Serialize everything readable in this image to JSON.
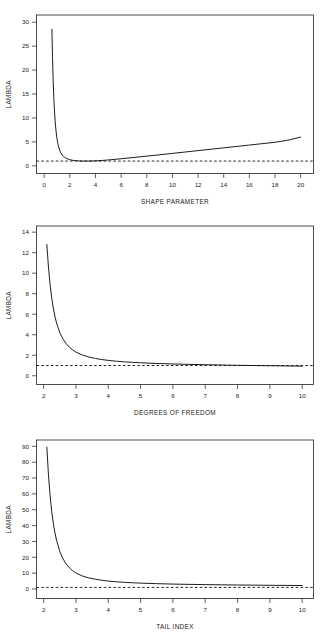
{
  "figure": {
    "background": "#ffffff",
    "line_color": "#111111",
    "axis_color": "#3a3a3a",
    "panel_count": 3
  },
  "chart_data": [
    {
      "id": "panel-shape-parameter",
      "type": "line",
      "title": "",
      "xlabel": "SHAPE PARAMETER",
      "ylabel": "LAMBDA",
      "xlim": [
        -0.6,
        21.0
      ],
      "ylim": [
        -1.6,
        31.5
      ],
      "xticks": [
        0,
        2,
        4,
        6,
        8,
        10,
        12,
        14,
        16,
        18,
        20
      ],
      "xticklabels": [
        "0",
        "2",
        "4",
        "6",
        "8",
        "10",
        "12",
        "14",
        "16",
        "18",
        "20"
      ],
      "yticks": [
        0,
        5,
        10,
        15,
        20,
        25,
        30
      ],
      "yticklabels": [
        "0",
        "5",
        "10",
        "15",
        "20",
        "25",
        "30"
      ],
      "grid": false,
      "legend": "none",
      "series": [
        {
          "name": "lambda",
          "style": "solid",
          "x": [
            0.6,
            0.65,
            0.7,
            0.75,
            0.8,
            0.85,
            0.9,
            0.95,
            1.0,
            1.05,
            1.1,
            1.2,
            1.3,
            1.4,
            1.5,
            1.6,
            1.8,
            2.0,
            2.25,
            2.5,
            2.75,
            3.0,
            3.5,
            4.0,
            4.5,
            5.0,
            6.0,
            7.0,
            8.0,
            9.0,
            10.0,
            11.0,
            12.0,
            13.0,
            14.0,
            15.0,
            16.0,
            17.0,
            18.0,
            19.0,
            20.0
          ],
          "y": [
            28.5,
            22.6,
            17.9,
            14.3,
            11.6,
            9.5,
            7.9,
            6.65,
            5.65,
            4.85,
            4.22,
            3.3,
            2.7,
            2.28,
            1.98,
            1.76,
            1.46,
            1.28,
            1.14,
            1.06,
            1.02,
            1.0,
            1.0,
            1.04,
            1.12,
            1.23,
            1.48,
            1.75,
            2.03,
            2.31,
            2.6,
            2.89,
            3.18,
            3.47,
            3.76,
            4.05,
            4.34,
            4.63,
            4.92,
            5.35,
            6.0
          ]
        },
        {
          "name": "reference",
          "style": "dashed",
          "value": 1.0,
          "x": [
            -0.6,
            21.0
          ],
          "y": [
            1.0,
            1.0
          ]
        }
      ]
    },
    {
      "id": "panel-degrees-of-freedom",
      "type": "line",
      "title": "",
      "xlabel": "DEGREES OF FREEDOM",
      "ylabel": "LAMBDA",
      "xlim": [
        1.78,
        10.35
      ],
      "ylim": [
        -0.85,
        14.6
      ],
      "xticks": [
        2,
        3,
        4,
        5,
        6,
        7,
        8,
        9,
        10
      ],
      "xticklabels": [
        "2",
        "3",
        "4",
        "5",
        "6",
        "7",
        "8",
        "9",
        "10"
      ],
      "yticks": [
        0,
        2,
        4,
        6,
        8,
        10,
        12,
        14
      ],
      "yticklabels": [
        "0",
        "2",
        "4",
        "6",
        "8",
        "10",
        "12",
        "14"
      ],
      "grid": false,
      "legend": "none",
      "series": [
        {
          "name": "lambda",
          "style": "solid",
          "x": [
            2.1,
            2.15,
            2.2,
            2.25,
            2.3,
            2.35,
            2.4,
            2.5,
            2.6,
            2.7,
            2.8,
            2.9,
            3.0,
            3.2,
            3.4,
            3.6,
            3.8,
            4.0,
            4.25,
            4.5,
            4.75,
            5.0,
            5.5,
            6.0,
            6.5,
            7.0,
            7.5,
            8.0,
            8.5,
            9.0,
            9.5,
            10.0
          ],
          "y": [
            12.8,
            10.6,
            8.9,
            7.6,
            6.6,
            5.8,
            5.15,
            4.2,
            3.58,
            3.12,
            2.78,
            2.52,
            2.31,
            2.02,
            1.83,
            1.69,
            1.58,
            1.5,
            1.42,
            1.36,
            1.31,
            1.27,
            1.2,
            1.15,
            1.11,
            1.08,
            1.05,
            1.02,
            1.0,
            0.98,
            0.96,
            0.94
          ]
        },
        {
          "name": "reference",
          "style": "dashed",
          "value": 1.0,
          "x": [
            1.78,
            10.35
          ],
          "y": [
            1.0,
            1.0
          ]
        }
      ]
    },
    {
      "id": "panel-tail-index",
      "type": "line",
      "title": "",
      "xlabel": "TAIL INDEX",
      "ylabel": "LAMBDA",
      "xlim": [
        1.78,
        10.35
      ],
      "ylim": [
        -6.0,
        94.0
      ],
      "xticks": [
        2,
        3,
        4,
        5,
        6,
        7,
        8,
        9,
        10
      ],
      "xticklabels": [
        "2",
        "3",
        "4",
        "5",
        "6",
        "7",
        "8",
        "9",
        "10"
      ],
      "yticks": [
        0,
        10,
        20,
        30,
        40,
        50,
        60,
        70,
        80,
        90
      ],
      "yticklabels": [
        "0",
        "10",
        "20",
        "30",
        "40",
        "50",
        "60",
        "70",
        "80",
        "90"
      ],
      "grid": false,
      "legend": "none",
      "series": [
        {
          "name": "lambda",
          "style": "solid",
          "x": [
            2.1,
            2.15,
            2.2,
            2.25,
            2.3,
            2.35,
            2.4,
            2.5,
            2.6,
            2.7,
            2.8,
            2.9,
            3.0,
            3.2,
            3.4,
            3.6,
            3.8,
            4.0,
            4.25,
            4.5,
            4.75,
            5.0,
            5.5,
            6.0,
            6.5,
            7.0,
            7.5,
            8.0,
            8.5,
            9.0,
            9.5,
            10.0
          ],
          "y": [
            89.5,
            72.0,
            59.0,
            49.0,
            41.5,
            35.5,
            30.8,
            23.8,
            19.0,
            15.7,
            13.3,
            11.5,
            10.1,
            8.2,
            7.0,
            6.15,
            5.5,
            5.0,
            4.55,
            4.2,
            3.92,
            3.7,
            3.36,
            3.1,
            2.92,
            2.76,
            2.64,
            2.52,
            2.42,
            2.33,
            2.26,
            2.18
          ]
        },
        {
          "name": "reference",
          "style": "dashed",
          "value": 1.0,
          "x": [
            1.78,
            10.35
          ],
          "y": [
            1.0,
            1.0
          ]
        }
      ]
    }
  ]
}
